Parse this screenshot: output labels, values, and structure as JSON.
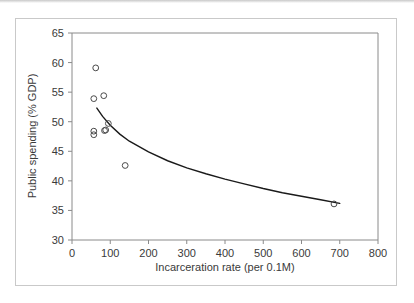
{
  "figure": {
    "caption": "",
    "background_color": "#ffffff",
    "frame_color": "#c9c9c9"
  },
  "chart_data": {
    "type": "scatter",
    "title": "",
    "xlabel": "Incarceration rate (per 0.1M)",
    "ylabel": "Public spending (% GDP)",
    "xlim": [
      0,
      800
    ],
    "ylim": [
      30,
      65
    ],
    "xticks": [
      0,
      100,
      200,
      300,
      400,
      500,
      600,
      700,
      800
    ],
    "xtick_labels": [
      "0",
      "100",
      "200",
      "300",
      "400",
      "500",
      "600",
      "700",
      "800"
    ],
    "yticks": [
      30,
      35,
      40,
      45,
      50,
      55,
      60,
      65
    ],
    "ytick_labels": [
      "30",
      "35",
      "40",
      "45",
      "50",
      "55",
      "60",
      "65"
    ],
    "grid": false,
    "legend": null,
    "marker": "open-circle",
    "marker_color": "#4a4a4a",
    "line_color": "#1a1a1a",
    "points": [
      {
        "x": 62,
        "y": 59.1
      },
      {
        "x": 57,
        "y": 53.9
      },
      {
        "x": 83,
        "y": 54.4
      },
      {
        "x": 95,
        "y": 49.7
      },
      {
        "x": 88,
        "y": 48.6
      },
      {
        "x": 85,
        "y": 48.5
      },
      {
        "x": 57,
        "y": 48.4
      },
      {
        "x": 57,
        "y": 47.8
      },
      {
        "x": 139,
        "y": 42.6
      },
      {
        "x": 685,
        "y": 36.1
      }
    ],
    "fit_curve": {
      "label": "power-law trend",
      "x_start": 65,
      "x_end": 700,
      "points": [
        {
          "x": 65,
          "y": 52.3
        },
        {
          "x": 80,
          "y": 50.9
        },
        {
          "x": 100,
          "y": 49.4
        },
        {
          "x": 125,
          "y": 47.9
        },
        {
          "x": 150,
          "y": 46.7
        },
        {
          "x": 200,
          "y": 44.9
        },
        {
          "x": 250,
          "y": 43.4
        },
        {
          "x": 300,
          "y": 42.2
        },
        {
          "x": 350,
          "y": 41.2
        },
        {
          "x": 400,
          "y": 40.3
        },
        {
          "x": 450,
          "y": 39.5
        },
        {
          "x": 500,
          "y": 38.7
        },
        {
          "x": 550,
          "y": 38.0
        },
        {
          "x": 600,
          "y": 37.4
        },
        {
          "x": 650,
          "y": 36.8
        },
        {
          "x": 700,
          "y": 36.2
        }
      ]
    }
  }
}
